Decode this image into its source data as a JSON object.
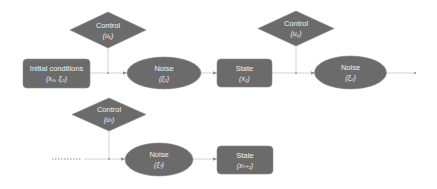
{
  "diagram": {
    "type": "flowchart",
    "colors": {
      "node_fill": "#6b6b6b",
      "text": "#f2f2f2",
      "edge": "#c8c8c8",
      "background": "#ffffff"
    },
    "nodes": {
      "control1": {
        "shape": "diamond",
        "label": "Control",
        "sub": "(u₁)"
      },
      "initial": {
        "shape": "rounded-rect",
        "label": "Initial conditions",
        "sub": "(x₀, ξ₀)"
      },
      "noise1": {
        "shape": "ellipse",
        "label": "Noise",
        "sub": "(ξ₁)"
      },
      "state2": {
        "shape": "rounded-rect",
        "label": "State",
        "sub": "(x₂)"
      },
      "control2": {
        "shape": "diamond",
        "label": "Control",
        "sub": "(u₂)"
      },
      "noise2": {
        "shape": "ellipse",
        "label": "Noise",
        "sub": "(ξ₂)"
      },
      "controlT": {
        "shape": "diamond",
        "label": "Control",
        "sub": "(uₜ)"
      },
      "noiseT": {
        "shape": "ellipse",
        "label": "Noise",
        "sub": "(ξₜ)"
      },
      "stateT1": {
        "shape": "rounded-rect",
        "label": "State",
        "sub": "(xₜ₊₁)"
      }
    },
    "edges": [
      {
        "from": "initial",
        "to": "noise1"
      },
      {
        "from": "control1",
        "to": "noise1"
      },
      {
        "from": "noise1",
        "to": "state2"
      },
      {
        "from": "state2",
        "to": "noise2"
      },
      {
        "from": "control2",
        "to": "noise2"
      },
      {
        "from": "noise2",
        "to": "..."
      },
      {
        "from": "...",
        "to": "noiseT"
      },
      {
        "from": "controlT",
        "to": "noiseT"
      },
      {
        "from": "noiseT",
        "to": "stateT1"
      }
    ]
  }
}
